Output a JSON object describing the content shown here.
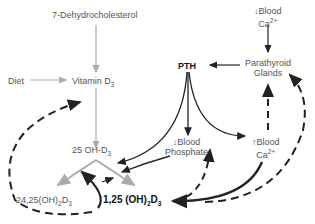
{
  "nodes": {
    "dehydrocholesterol": "7-Dehydrocholesterol",
    "diet": "Diet",
    "vitamin_d3": {
      "main": "Vitamin D",
      "sub": "3"
    },
    "oh_d3": {
      "main": "25 OH-D",
      "sub": "3"
    },
    "dihydroxy_24_25": {
      "a": "24,25(OH)",
      "s1": "2",
      "b": "D",
      "s2": "3"
    },
    "dihydroxy_1_25": {
      "a": "1,25 (OH)",
      "s1": "2",
      "b": "D",
      "s2": "3"
    },
    "pth": "PTH",
    "blood_ca_low": {
      "arrow": "↓",
      "line1": "Blood",
      "line2": "Ca",
      "sup": "2+"
    },
    "parathyroid": {
      "line1": "Parathyroid",
      "line2": "Glands"
    },
    "blood_phosphate_low": {
      "arrow": "↓",
      "line1": "Blood",
      "line2": "Phosphate"
    },
    "blood_ca_high": {
      "arrow": "↑",
      "line1": "Blood",
      "line2": "Ca",
      "sup": "2+"
    }
  },
  "colors": {
    "gray_arrow": "#aaaaaa",
    "dark_arrow": "#222222",
    "text": "#555555"
  }
}
